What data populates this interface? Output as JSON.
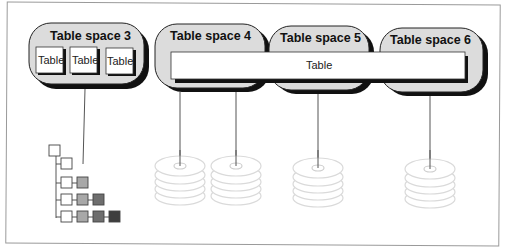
{
  "diagram": {
    "colors": {
      "tablespace_fill": "#dcdcdc",
      "shadow": "#111111",
      "table_fill": "#ffffff",
      "disk_stroke": "#d8d8d8",
      "connector": "#555555",
      "tree_shades": [
        "#ffffff",
        "#a8a8a8",
        "#6e6e6e",
        "#3e3e3e"
      ]
    },
    "tablespaces": [
      {
        "label": "Table space 3",
        "tables": [
          "Table",
          "Table",
          "Table"
        ]
      },
      {
        "label": "Table space 4"
      },
      {
        "label": "Table space 5"
      },
      {
        "label": "Table space 6"
      }
    ],
    "spanning_table": {
      "label": "Table"
    },
    "disk_stacks": 4,
    "tree": {
      "rows": 5
    }
  }
}
